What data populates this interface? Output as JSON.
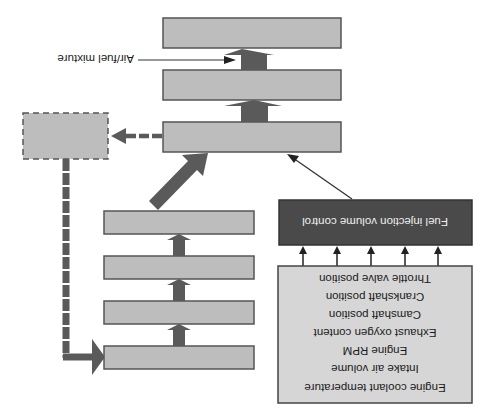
{
  "diagram": {
    "orientation": "rotated-180",
    "colors": {
      "box_fill": "#bdbdbd",
      "box_stroke": "#555555",
      "dark_box_fill": "#4a4a4a",
      "input_box_fill": "#d6d6d6",
      "arrow_fill": "#5a5a5a",
      "background": "#ffffff"
    },
    "top_stack": {
      "boxes": [
        {
          "id": "top-box-1",
          "label": ""
        },
        {
          "id": "top-box-2",
          "label": ""
        },
        {
          "id": "top-box-3",
          "label": ""
        }
      ],
      "annotation": "Air/fuel mixture"
    },
    "left_stack": {
      "boxes": [
        {
          "id": "left-box-1",
          "label": ""
        },
        {
          "id": "left-box-2",
          "label": ""
        },
        {
          "id": "left-box-3",
          "label": ""
        },
        {
          "id": "left-box-4",
          "label": ""
        }
      ]
    },
    "control_box": {
      "label": "Fuel injection volume control"
    },
    "inputs_box": {
      "items": [
        "Engine coolant temperature",
        "Intake air volume",
        "Engine RPM",
        "Exhaust oxygen content",
        "Camshaft position",
        "Crankshaft position",
        "Throttle valve position"
      ]
    },
    "feedback_box": {
      "label": "",
      "style": "dashed"
    }
  }
}
